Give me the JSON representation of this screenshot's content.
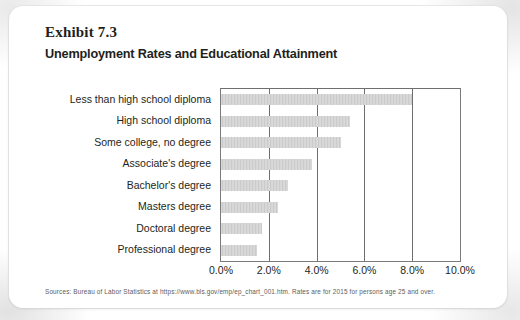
{
  "exhibit": {
    "label": "Exhibit 7.3",
    "title": "Unemployment Rates and Educational Attainment"
  },
  "source_note": "Sources: Bureau of Labor Statistics at https://www.bls.gov/emp/ep_chart_001.htm. Rates are for 2015 for persons age 25 and over.",
  "colors": {
    "bar_fill": "#cbcbcb",
    "axis": "#6f6f6f",
    "text": "#231f20",
    "card": "#ffffff",
    "note_text": "#5c5c5c"
  },
  "chart_data": {
    "type": "bar",
    "orientation": "horizontal",
    "title": "Unemployment Rates and Educational Attainment",
    "subtitle": "Exhibit 7.3",
    "xlabel": "",
    "ylabel": "",
    "categories": [
      "Less than high school diploma",
      "High school diploma",
      "Some college, no degree",
      "Associate's degree",
      "Bachelor's degree",
      "Masters degree",
      "Doctoral degree",
      "Professional degree"
    ],
    "values": [
      8.0,
      5.4,
      5.0,
      3.8,
      2.8,
      2.4,
      1.7,
      1.5
    ],
    "xlim": [
      0.0,
      10.0
    ],
    "xticks": [
      0.0,
      2.0,
      4.0,
      6.0,
      8.0,
      10.0
    ],
    "xtick_labels": [
      "0.0%",
      "2.0%",
      "4.0%",
      "6.0%",
      "8.0%",
      "10.0%"
    ],
    "grid": "vertical",
    "legend": "none",
    "value_unit": "%"
  }
}
